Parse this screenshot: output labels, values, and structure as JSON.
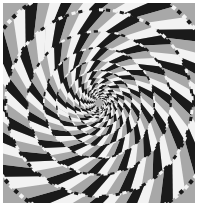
{
  "image": {
    "subject": "Fraser spiral illusion",
    "description": "Concentric circles made of twisted black and white segments over a checkerboard of tilted gray, black and white squares, appearing to spiral toward the center",
    "colors": {
      "background": "#ffffff",
      "gray": "#a8a8a8",
      "dark": "#1a1a1a",
      "light": "#f2f2f2"
    },
    "center": [
      96,
      100
    ],
    "ring_count": 14
  }
}
